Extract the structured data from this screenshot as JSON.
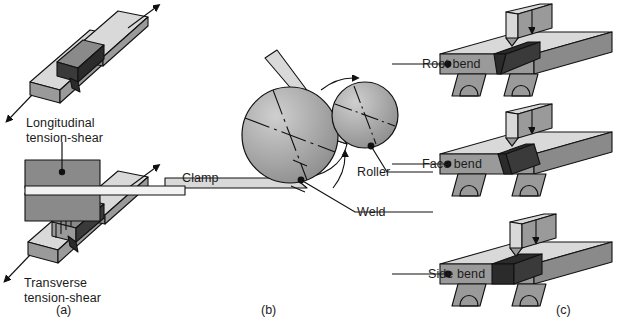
{
  "figure": {
    "domain": "technical-illustration",
    "background_color": "#ffffff",
    "line_color": "#111111",
    "text_color": "#1a1a1a"
  },
  "panels": [
    {
      "id": "a",
      "label": "(a)",
      "name": "shear-test-panel",
      "specimens": [
        {
          "name": "longitudinal-specimen",
          "label_line_1": "Longitudinal",
          "label_line_2": "tension-shear",
          "arrows": [
            "up-right",
            "down-left"
          ]
        },
        {
          "name": "transverse-specimen",
          "label_line_1": "Transverse",
          "label_line_2": "tension-shear",
          "arrows": [
            "up-right",
            "down-left"
          ]
        }
      ]
    },
    {
      "id": "b",
      "label": "(b)",
      "name": "wrap-around-bend-panel",
      "callouts": [
        {
          "name": "clamp-callout",
          "label": "Clamp"
        },
        {
          "name": "roller-callout",
          "label": "Roller"
        },
        {
          "name": "weld-callout",
          "label": "Weld"
        }
      ],
      "rotation_arrows": 2
    },
    {
      "id": "c",
      "label": "(c)",
      "name": "guided-bend-panel",
      "specimens": [
        {
          "name": "root-bend-specimen",
          "label": "Root bend",
          "weld_shape": "narrow-taper-down"
        },
        {
          "name": "face-bend-specimen",
          "label": "Face bend",
          "weld_shape": "narrow-taper-up"
        },
        {
          "name": "side-bend-specimen",
          "label": "Side bend",
          "weld_shape": "wide-block"
        }
      ],
      "plunger_arrow": "down"
    }
  ],
  "colors": {
    "light_gray": "#d9d9d9",
    "mid_gray": "#9a9a9a",
    "dark_gray": "#3a3a3a",
    "very_dark": "#2b2b2b",
    "white_face": "#f2f2f2"
  }
}
